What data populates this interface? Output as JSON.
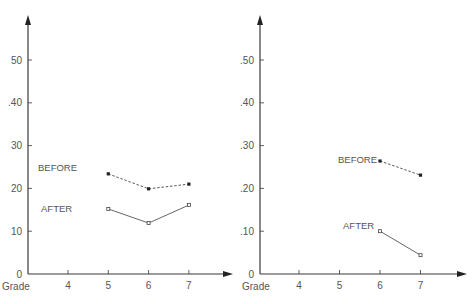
{
  "chart_data": [
    {
      "type": "line",
      "title": "",
      "xlabel": "Grade",
      "ylabel": "",
      "x_ticks": [
        "4",
        "5",
        "6",
        "7"
      ],
      "y_ticks": [
        "0",
        "10",
        "20",
        "30",
        ".40",
        "50"
      ],
      "ylim": [
        0,
        58
      ],
      "grid": false,
      "series": [
        {
          "name": "BEFORE",
          "style": "dashed",
          "marker": "filled-square",
          "x": [
            5,
            6,
            7
          ],
          "values": [
            23.4,
            19.9,
            21.0
          ]
        },
        {
          "name": "AFTER",
          "style": "solid",
          "marker": "open-square",
          "x": [
            5,
            6,
            7
          ],
          "values": [
            15.2,
            11.9,
            16.1
          ]
        }
      ]
    },
    {
      "type": "line",
      "title": "",
      "xlabel": "Grade",
      "ylabel": "",
      "x_ticks": [
        "4",
        "5",
        "6",
        "7"
      ],
      "y_ticks": [
        "0",
        ".10",
        ".20",
        ".30",
        ".40",
        ".50"
      ],
      "ylim": [
        0,
        58
      ],
      "grid": false,
      "series": [
        {
          "name": "BEFORE",
          "style": "dashed",
          "marker": "filled-square",
          "x": [
            6,
            7
          ],
          "values": [
            26.4,
            23.1
          ]
        },
        {
          "name": "AFTER",
          "style": "solid",
          "marker": "open-square",
          "x": [
            6,
            7
          ],
          "values": [
            10.0,
            4.4
          ]
        }
      ]
    }
  ]
}
